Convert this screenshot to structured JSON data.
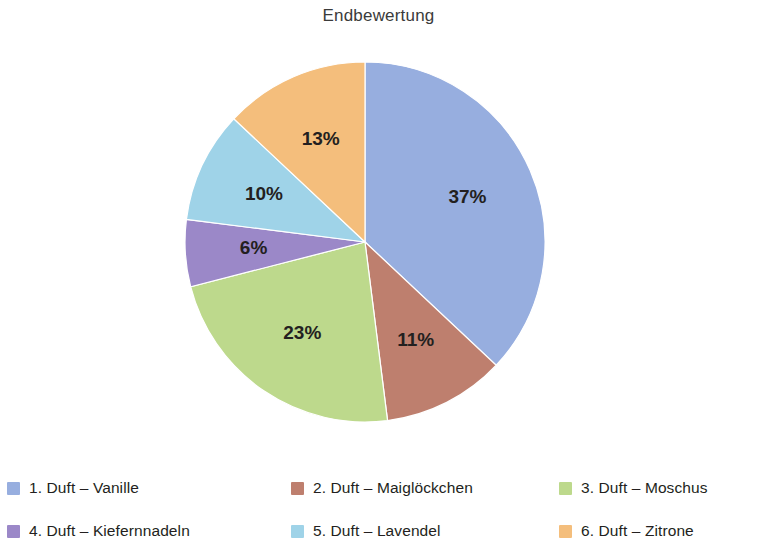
{
  "chart_data": {
    "type": "pie",
    "title": "Endbewertung",
    "categories": [
      "1. Duft – Vanille",
      "2. Duft – Maiglöckchen",
      "3. Duft – Moschus",
      "4. Duft – Kiefernnadeln",
      "5. Duft – Lavendel",
      "6. Duft – Zitrone"
    ],
    "values": [
      37,
      11,
      23,
      6,
      10,
      13
    ],
    "data_labels": [
      "37%",
      "11%",
      "23%",
      "6%",
      "10%",
      "13%"
    ],
    "unit": "%",
    "colors": [
      "#97AEDF",
      "#BE7F6E",
      "#BDD98C",
      "#9B88C8",
      "#9FD3E8",
      "#F4BE7C"
    ],
    "start_angle_deg": 0,
    "direction": "clockwise",
    "legend_position": "bottom",
    "legend_columns": 3,
    "grid": false,
    "xlabel": "",
    "ylabel": ""
  },
  "chart": {
    "title": "Endbewertung",
    "slices": [
      {
        "label": "37%",
        "value": 37,
        "color": "#97AEDF",
        "name": "1. Duft – Vanille"
      },
      {
        "label": "11%",
        "value": 11,
        "color": "#BE7F6E",
        "name": "2. Duft – Maiglöckchen"
      },
      {
        "label": "23%",
        "value": 23,
        "color": "#BDD98C",
        "name": "3. Duft – Moschus"
      },
      {
        "label": "6%",
        "value": 6,
        "color": "#9B88C8",
        "name": "4. Duft – Kiefernnadeln"
      },
      {
        "label": "10%",
        "value": 10,
        "color": "#9FD3E8",
        "name": "5. Duft – Lavendel"
      },
      {
        "label": "13%",
        "value": 13,
        "color": "#F4BE7C",
        "name": "6. Duft – Zitrone"
      }
    ]
  },
  "legend": {
    "rows": [
      [
        {
          "label": "1. Duft – Vanille",
          "color": "#97AEDF"
        },
        {
          "label": "2. Duft – Maiglöckchen",
          "color": "#BE7F6E"
        },
        {
          "label": "3. Duft – Moschus",
          "color": "#BDD98C"
        }
      ],
      [
        {
          "label": "4. Duft – Kiefernnadeln",
          "color": "#9B88C8"
        },
        {
          "label": "5. Duft – Lavendel",
          "color": "#9FD3E8"
        },
        {
          "label": "6. Duft – Zitrone",
          "color": "#F4BE7C"
        }
      ]
    ]
  }
}
